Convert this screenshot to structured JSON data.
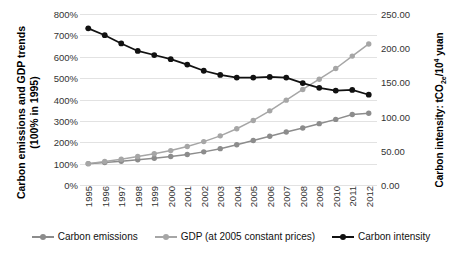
{
  "axes": {
    "y_left_title": "Carbon emissions and GDP trends\n(100% in 1995)",
    "y_right_title_pre": "Carbon intensity: tCO",
    "y_right_title_sub": "2e",
    "y_right_title_mid": "/10",
    "y_right_title_sup": "4",
    "y_right_title_post": " yuan",
    "y_left_ticks": [
      "800%",
      "700%",
      "600%",
      "500%",
      "400%",
      "300%",
      "200%",
      "100%",
      "0%"
    ],
    "y_right_ticks": [
      "250.00",
      "200.00",
      "150.00",
      "100.00",
      "50.00",
      "0.00"
    ]
  },
  "colors": {
    "carbon_emissions": "#8c8c8c",
    "gdp": "#a6a6a6",
    "carbon_intensity": "#111111",
    "gridline": "#e2e2e2"
  },
  "chart_data": {
    "type": "line",
    "title": "",
    "xlabel": "",
    "ylabel": "Carbon emissions and GDP trends (100% in 1995)",
    "y2label": "Carbon intensity: tCO2e/10^4 yuan",
    "grid": true,
    "legend_position": "bottom",
    "categories": [
      "1995",
      "1996",
      "1997",
      "1998",
      "1999",
      "2000",
      "2001",
      "2002",
      "2003",
      "2004",
      "2005",
      "2006",
      "2007",
      "2008",
      "2009",
      "2010",
      "2011",
      "2012"
    ],
    "ylim": [
      0,
      800
    ],
    "y2lim": [
      0,
      250
    ],
    "series": [
      {
        "name": "Carbon emissions",
        "axis": "left",
        "color": "#8c8c8c",
        "values": [
          100,
          105,
          111,
          118,
          125,
          133,
          143,
          155,
          170,
          188,
          208,
          228,
          248,
          267,
          287,
          307,
          330,
          336
        ]
      },
      {
        "name": "GDP (at 2005 constant prices)",
        "axis": "left",
        "color": "#a6a6a6",
        "values": [
          100,
          110,
          121,
          133,
          146,
          161,
          180,
          203,
          230,
          263,
          302,
          347,
          397,
          447,
          495,
          545,
          603,
          660
        ]
      },
      {
        "name": "Carbon intensity",
        "axis": "right",
        "color": "#111111",
        "values": [
          229,
          219,
          207,
          196,
          190,
          184,
          176,
          167,
          161,
          157,
          157,
          158,
          157,
          149,
          142,
          138,
          139,
          132
        ]
      }
    ]
  },
  "legend": {
    "items": [
      {
        "label": "Carbon emissions",
        "color": "#8c8c8c"
      },
      {
        "label": "GDP (at 2005 constant prices)",
        "color": "#a6a6a6"
      },
      {
        "label": "Carbon intensity",
        "color": "#111111"
      }
    ]
  }
}
